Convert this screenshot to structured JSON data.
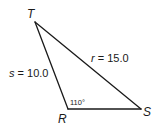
{
  "diagram": {
    "type": "triangle",
    "vertices": [
      {
        "id": "T",
        "label": "T"
      },
      {
        "id": "R",
        "label": "R"
      },
      {
        "id": "S",
        "label": "S"
      }
    ],
    "sides": {
      "s": {
        "var": "s",
        "text": " = 10.0",
        "value": 10.0,
        "between": [
          "T",
          "R"
        ]
      },
      "r": {
        "var": "r",
        "text": " = 15.0",
        "value": 15.0,
        "between": [
          "T",
          "S"
        ]
      },
      "t": {
        "between": [
          "R",
          "S"
        ]
      }
    },
    "angle_R": {
      "label": "110°",
      "value": 110
    }
  }
}
